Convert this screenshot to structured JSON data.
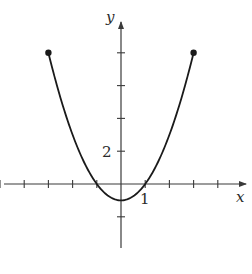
{
  "chart_data": {
    "type": "line",
    "title": "",
    "xlabel": "x",
    "ylabel": "y",
    "function": "f(x) = x^2 - 1",
    "domain": [
      -3,
      3
    ],
    "series": [
      {
        "name": "f",
        "x": [
          -3,
          -2.5,
          -2,
          -1.5,
          -1,
          -0.5,
          0,
          0.5,
          1,
          1.5,
          2,
          2.5,
          3
        ],
        "y": [
          8,
          5.25,
          3,
          1.25,
          0,
          -0.75,
          -1,
          -0.75,
          0,
          1.25,
          3,
          5.25,
          8
        ]
      }
    ],
    "endpoints": [
      {
        "x": -3,
        "y": 8,
        "style": "closed-dot"
      },
      {
        "x": 3,
        "y": 8,
        "style": "closed-dot"
      }
    ],
    "x_ticks": [
      -5,
      -4,
      -3,
      -2,
      -1,
      1,
      2,
      3,
      4
    ],
    "y_ticks": [
      -2,
      2,
      4,
      6,
      8
    ],
    "tick_labels": [
      {
        "axis": "x",
        "value": 1,
        "text": "1"
      },
      {
        "axis": "y",
        "value": 2,
        "text": "2"
      }
    ],
    "xlim": [
      -5,
      5
    ],
    "ylim": [
      -4,
      10
    ],
    "grid": false,
    "legend": null
  },
  "labels": {
    "x_axis": "x",
    "y_axis": "y",
    "x_tick_1": "1",
    "y_tick_2": "2"
  },
  "colors": {
    "curve": "#1a1a1a",
    "axes": "#3a3a3a",
    "background": "#ffffff"
  }
}
